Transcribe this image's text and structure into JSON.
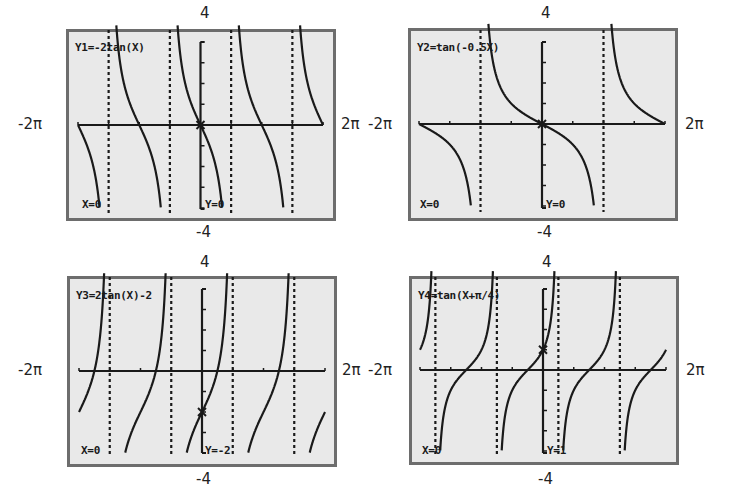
{
  "window": {
    "xmin_label": "-2π",
    "xmax_label": "2π",
    "ymax_label": "4",
    "ymin_label": "-4"
  },
  "colors": {
    "screen_bg": "#e9e9e9",
    "border": "#6d6d6d",
    "ink": "#1a1a1a"
  },
  "panels": [
    {
      "equation": "Y1=-2tan(X)",
      "cursor_x": "X=0",
      "cursor_y": "Y=0",
      "box": [
        66,
        29,
        269,
        191
      ],
      "plot": {
        "x0": 78,
        "x1": 323,
        "yc": 125,
        "ytop": 42,
        "ybot": 209
      },
      "label_pos": {
        "top": [
          200,
          6
        ],
        "bottom": [
          200,
          224
        ],
        "left": [
          18,
          118
        ],
        "right": [
          341,
          118
        ]
      }
    },
    {
      "equation": "Y2=tan(-0.5X)",
      "cursor_x": "X=0",
      "cursor_y": "Y=0",
      "box": [
        408,
        28,
        269,
        192
      ],
      "plot": {
        "x0": 419,
        "x1": 665,
        "yc": 124,
        "ytop": 42,
        "ybot": 208
      },
      "label_pos": {
        "top": [
          541,
          6
        ],
        "bottom": [
          541,
          224
        ],
        "left": [
          369,
          118
        ],
        "right": [
          684,
          118
        ]
      }
    },
    {
      "equation": "Y3=2tan(X)-2",
      "cursor_x": "X=0",
      "cursor_y": "Y=-2",
      "box": [
        67,
        276,
        269,
        190
      ],
      "plot": {
        "x0": 79,
        "x1": 325,
        "yc": 371,
        "ytop": 289,
        "ybot": 453
      },
      "label_pos": {
        "top": [
          202,
          254
        ],
        "bottom": [
          202,
          470
        ],
        "left": [
          18,
          363
        ],
        "right": [
          342,
          363
        ]
      }
    },
    {
      "equation": "Y4=tan(X+π/4)",
      "cursor_x": "X=0",
      "cursor_y": "Y=1",
      "box": [
        409,
        276,
        269,
        188
      ],
      "plot": {
        "x0": 420,
        "x1": 666,
        "yc": 370,
        "ytop": 289,
        "ybot": 453
      },
      "label_pos": {
        "top": [
          543,
          254
        ],
        "bottom": [
          543,
          470
        ],
        "left": [
          369,
          363
        ],
        "right": [
          685,
          363
        ]
      }
    }
  ],
  "chart_data": [
    {
      "type": "line",
      "title": "Y1=-2tan(X)",
      "function": "-2*tan(x)",
      "xlim": [
        "-2π",
        "2π"
      ],
      "ylim": [
        -4,
        4
      ],
      "xscl": "π/2",
      "yscl": 1,
      "asymptotes": [
        "-3π/2",
        "-π/2",
        "π/2",
        "3π/2"
      ],
      "trace_point": {
        "x": 0,
        "y": 0
      },
      "grid": false
    },
    {
      "type": "line",
      "title": "Y2=tan(-0.5X)",
      "function": "tan(-0.5*x)",
      "xlim": [
        "-2π",
        "2π"
      ],
      "ylim": [
        -4,
        4
      ],
      "xscl": "π/2",
      "yscl": 1,
      "asymptotes": [
        "-π",
        "π"
      ],
      "trace_point": {
        "x": 0,
        "y": 0
      },
      "grid": false
    },
    {
      "type": "line",
      "title": "Y3=2tan(X)-2",
      "function": "2*tan(x)-2",
      "xlim": [
        "-2π",
        "2π"
      ],
      "ylim": [
        -4,
        4
      ],
      "xscl": "π/2",
      "yscl": 1,
      "asymptotes": [
        "-3π/2",
        "-π/2",
        "π/2",
        "3π/2"
      ],
      "trace_point": {
        "x": 0,
        "y": -2
      },
      "grid": false
    },
    {
      "type": "line",
      "title": "Y4=tan(X+π/4)",
      "function": "tan(x+pi/4)",
      "xlim": [
        "-2π",
        "2π"
      ],
      "ylim": [
        -4,
        4
      ],
      "xscl": "π/2",
      "yscl": 1,
      "asymptotes": [
        "-7π/4",
        "-3π/4",
        "π/4",
        "5π/4"
      ],
      "trace_point": {
        "x": 0,
        "y": 1
      },
      "grid": false
    }
  ]
}
